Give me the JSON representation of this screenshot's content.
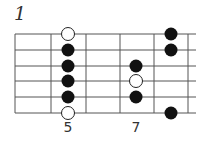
{
  "diagram": {
    "number": "1",
    "colors": {
      "line": "#555555",
      "dot_filled": "#111111",
      "dot_open": "#ffffff"
    },
    "strings": 6,
    "fret_labels": [
      {
        "label": "5",
        "x": 68
      },
      {
        "label": "7",
        "x": 136
      }
    ],
    "notes": [
      {
        "string": 1,
        "fret_pos": "5",
        "type": "open"
      },
      {
        "string": 2,
        "fret_pos": "5",
        "type": "filled"
      },
      {
        "string": 3,
        "fret_pos": "5",
        "type": "filled"
      },
      {
        "string": 4,
        "fret_pos": "5",
        "type": "filled"
      },
      {
        "string": 5,
        "fret_pos": "5",
        "type": "filled"
      },
      {
        "string": 6,
        "fret_pos": "5",
        "type": "open"
      },
      {
        "string": 3,
        "fret_pos": "7",
        "type": "filled"
      },
      {
        "string": 4,
        "fret_pos": "7",
        "type": "open"
      },
      {
        "string": 5,
        "fret_pos": "7",
        "type": "filled"
      },
      {
        "string": 1,
        "fret_pos": "8",
        "type": "filled"
      },
      {
        "string": 2,
        "fret_pos": "8",
        "type": "filled"
      },
      {
        "string": 6,
        "fret_pos": "8",
        "type": "filled"
      }
    ]
  }
}
